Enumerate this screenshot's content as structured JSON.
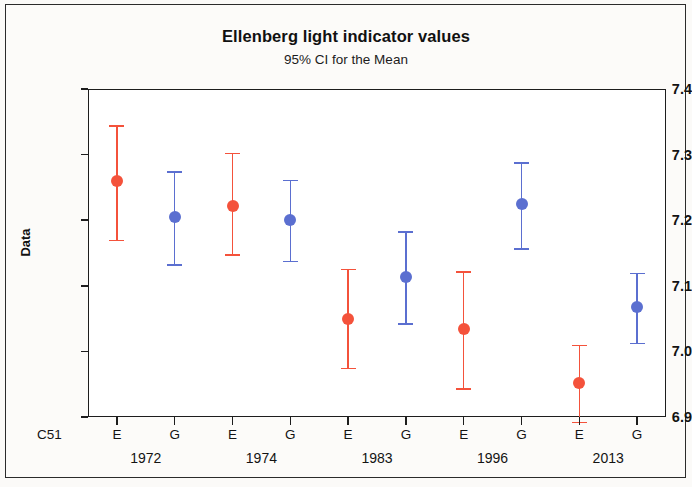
{
  "chart_data": {
    "type": "scatter",
    "title": "Ellenberg light indicator values",
    "subtitle": "95% CI for the Mean",
    "ylabel": "Data",
    "xlabel": "",
    "row_label": "C51",
    "ylim": [
      6.9,
      7.4
    ],
    "yticks": [
      "6.9",
      "7.0",
      "7.1",
      "7.2",
      "7.3",
      "7.4"
    ],
    "ytick_values": [
      6.9,
      7.0,
      7.1,
      7.2,
      7.3,
      7.4
    ],
    "grid": false,
    "legend": "none",
    "groups": [
      "1972",
      "1974",
      "1983",
      "1996",
      "2013"
    ],
    "subcategories": [
      "E",
      "G"
    ],
    "colors": {
      "E": "#f4523b",
      "G": "#5b6fd0"
    },
    "series": [
      {
        "name": "E",
        "color": "#f4523b",
        "categories": [
          "1972",
          "1974",
          "1983",
          "1996",
          "2013"
        ],
        "values": [
          7.26,
          7.222,
          7.05,
          7.034,
          6.952
        ],
        "ci_lower": [
          7.17,
          7.148,
          6.975,
          6.944,
          6.893
        ],
        "ci_upper": [
          7.345,
          7.303,
          7.126,
          7.122,
          7.01
        ]
      },
      {
        "name": "G",
        "color": "#5b6fd0",
        "categories": [
          "1972",
          "1974",
          "1983",
          "1996",
          "2013"
        ],
        "values": [
          7.205,
          7.201,
          7.114,
          7.224,
          7.067
        ],
        "ci_lower": [
          7.133,
          7.138,
          7.043,
          7.157,
          7.013
        ],
        "ci_upper": [
          7.275,
          7.262,
          7.183,
          7.288,
          7.12
        ]
      }
    ],
    "points": [
      {
        "group": "1972",
        "sub": "E",
        "mean": 7.26,
        "lower": 7.17,
        "upper": 7.345
      },
      {
        "group": "1972",
        "sub": "G",
        "mean": 7.205,
        "lower": 7.133,
        "upper": 7.275
      },
      {
        "group": "1974",
        "sub": "E",
        "mean": 7.222,
        "lower": 7.148,
        "upper": 7.303
      },
      {
        "group": "1974",
        "sub": "G",
        "mean": 7.201,
        "lower": 7.138,
        "upper": 7.262
      },
      {
        "group": "1983",
        "sub": "E",
        "mean": 7.05,
        "lower": 6.975,
        "upper": 7.126
      },
      {
        "group": "1983",
        "sub": "G",
        "mean": 7.114,
        "lower": 7.043,
        "upper": 7.183
      },
      {
        "group": "1996",
        "sub": "E",
        "mean": 7.034,
        "lower": 6.944,
        "upper": 7.122
      },
      {
        "group": "1996",
        "sub": "G",
        "mean": 7.224,
        "lower": 7.157,
        "upper": 7.288
      },
      {
        "group": "2013",
        "sub": "E",
        "mean": 6.952,
        "lower": 6.893,
        "upper": 7.01
      },
      {
        "group": "2013",
        "sub": "G",
        "mean": 7.067,
        "lower": 7.013,
        "upper": 7.12
      }
    ]
  }
}
